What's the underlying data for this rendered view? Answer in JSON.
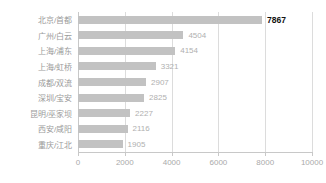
{
  "chart_data": {
    "type": "bar",
    "orientation": "horizontal",
    "title": "",
    "xlabel": "",
    "ylabel": "",
    "xlim": [
      0,
      10000
    ],
    "xticks": [
      0,
      2000,
      4000,
      6000,
      8000,
      10000
    ],
    "xtick_labels": [
      "0",
      "2000",
      "4000",
      "6000",
      "8000",
      "10000"
    ],
    "grid": true,
    "legend": false,
    "categories": [
      "北京/首都",
      "广州/白云",
      "上海/浦东",
      "上海/虹桥",
      "成都/双流",
      "深圳/宝安",
      "昆明/巫家坝",
      "西安/咸阳",
      "重庆/江北"
    ],
    "values": [
      7867,
      4504,
      4154,
      3321,
      2907,
      2825,
      2227,
      2116,
      1905
    ],
    "value_labels": [
      "7867",
      "4504",
      "4154",
      "3321",
      "2907",
      "2825",
      "2227",
      "2116",
      "1905"
    ],
    "highlight_index": 0,
    "colors": {
      "bar": "#c2c2c2",
      "value_label": "#b0b0b0",
      "value_label_highlight": "#111111",
      "category_label": "#9a9a9a",
      "gridline": "#dcdcdc",
      "axis": "#c8c8c8",
      "background": "#ffffff"
    }
  }
}
